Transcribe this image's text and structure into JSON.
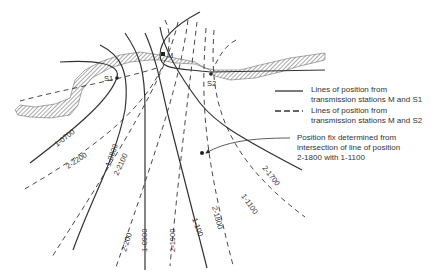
{
  "stations": {
    "m": "M",
    "s1": "S1",
    "s2": "S2"
  },
  "legend": {
    "solid_line_text": "Lines of position from transmission stations M and S1",
    "solid_line_1": "Lines of position from",
    "solid_line_2": "transmission stations M and S1",
    "dashed_line_1": "Lines of position from",
    "dashed_line_2": "transmission stations M and S2"
  },
  "annotation": {
    "line1": "Position fix determined from",
    "line2": "intersection of line of position",
    "line3": "2-1800 with 1-1100"
  },
  "solid_line_labels": [
    "1-0700",
    "1-0800",
    "1-0900",
    "1-100",
    "1-1100"
  ],
  "dashed_line_labels": [
    "2-2200",
    "2-2100",
    "2-200",
    "2-1900",
    "2-1800",
    "2-1700"
  ],
  "colors": {
    "ink": "#333333",
    "coast_hatch": "#555555",
    "background": "#ffffff"
  }
}
